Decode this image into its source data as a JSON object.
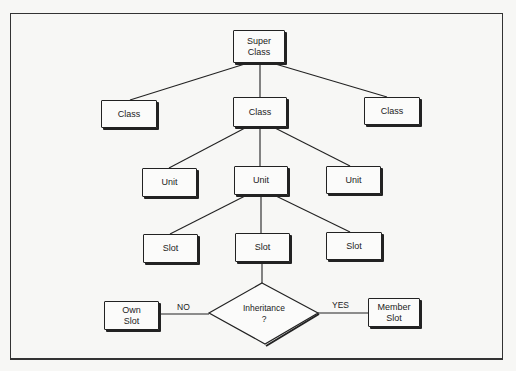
{
  "diagram": {
    "type": "hierarchy-flowchart",
    "nodes": {
      "super_class": {
        "line1": "Super",
        "line2": "Class"
      },
      "class_left": {
        "label": "Class"
      },
      "class_center": {
        "label": "Class"
      },
      "class_right": {
        "label": "Class"
      },
      "unit_left": {
        "label": "Unit"
      },
      "unit_center": {
        "label": "Unit"
      },
      "unit_right": {
        "label": "Unit"
      },
      "slot_left": {
        "label": "Slot"
      },
      "slot_center": {
        "label": "Slot"
      },
      "slot_right": {
        "label": "Slot"
      },
      "decision": {
        "line1": "Inheritance",
        "line2": "?"
      },
      "own_slot": {
        "line1": "Own",
        "line2": "Slot"
      },
      "member_slot": {
        "line1": "Member",
        "line2": "Slot"
      }
    },
    "edge_labels": {
      "no": "NO",
      "yes": "YES"
    },
    "edges": [
      [
        "super_class",
        "class_left"
      ],
      [
        "super_class",
        "class_center"
      ],
      [
        "super_class",
        "class_right"
      ],
      [
        "class_center",
        "unit_left"
      ],
      [
        "class_center",
        "unit_center"
      ],
      [
        "class_center",
        "unit_right"
      ],
      [
        "unit_center",
        "slot_left"
      ],
      [
        "unit_center",
        "slot_center"
      ],
      [
        "unit_center",
        "slot_right"
      ],
      [
        "slot_center",
        "decision"
      ],
      [
        "decision",
        "own_slot",
        "NO"
      ],
      [
        "decision",
        "member_slot",
        "YES"
      ]
    ]
  }
}
